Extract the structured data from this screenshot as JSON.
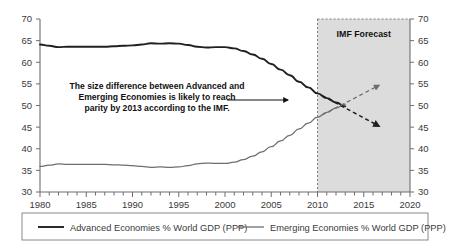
{
  "chart_data": {
    "type": "line",
    "title": "",
    "xlabel": "",
    "ylabel": "",
    "xlim": [
      1980,
      2020
    ],
    "ylim": [
      30,
      70
    ],
    "ytick_step": 5,
    "xtick_step": 5,
    "grid": false,
    "legend_position": "bottom",
    "dual_y_axis": true,
    "x": [
      1980,
      1981,
      1982,
      1983,
      1984,
      1985,
      1986,
      1987,
      1988,
      1989,
      1990,
      1991,
      1992,
      1993,
      1994,
      1995,
      1996,
      1997,
      1998,
      1999,
      2000,
      2001,
      2002,
      2003,
      2004,
      2005,
      2006,
      2007,
      2008,
      2009,
      2010,
      2011,
      2012,
      2013,
      2014,
      2015,
      2016
    ],
    "series": [
      {
        "name": "Advanced Economies % World GDP (PPP)",
        "color": "#231f20",
        "values": [
          64.1,
          63.8,
          63.5,
          63.6,
          63.6,
          63.6,
          63.6,
          63.6,
          63.7,
          63.8,
          63.9,
          64.1,
          64.4,
          64.3,
          64.4,
          64.3,
          64.0,
          63.6,
          63.4,
          63.5,
          63.5,
          63.2,
          62.6,
          61.8,
          60.8,
          59.6,
          58.3,
          57.0,
          55.5,
          54.2,
          52.8,
          51.7,
          50.7,
          49.8,
          48.8,
          47.5,
          45.2
        ]
      },
      {
        "name": "Emerging Economies % World GDP (PPP)",
        "color": "#6e6e6e",
        "values": [
          35.9,
          36.2,
          36.5,
          36.4,
          36.4,
          36.4,
          36.4,
          36.4,
          36.3,
          36.2,
          36.1,
          35.9,
          35.7,
          35.8,
          35.7,
          35.8,
          36.1,
          36.5,
          36.7,
          36.6,
          36.6,
          36.9,
          37.5,
          38.3,
          39.3,
          40.5,
          41.8,
          43.1,
          44.6,
          45.9,
          47.3,
          48.4,
          49.4,
          50.3,
          51.3,
          52.6,
          54.5
        ]
      }
    ],
    "ytick_labels": [
      "30",
      "35",
      "40",
      "45",
      "50",
      "55",
      "60",
      "65",
      "70"
    ],
    "xtick_labels": [
      "1980",
      "1985",
      "1990",
      "1995",
      "2000",
      "2005",
      "2010",
      "2015",
      "2020"
    ],
    "forecast_region": {
      "label": "IMF Forecast",
      "start_year": 2010,
      "end_year": 2020,
      "fill_color": "#dcdcdc",
      "border_color": "#7a7a7a"
    },
    "annotation": {
      "line1": "The size difference between Advanced and",
      "line2": "Emerging Economies is likely to reach",
      "line3": "parity by 2013 according to the IMF."
    }
  },
  "legend": {
    "items": [
      {
        "label": "Advanced Economies % World GDP (PPP)",
        "color": "#231f20"
      },
      {
        "label": "Emerging Economies % World GDP (PPP)",
        "color": "#6e6e6e"
      }
    ]
  }
}
